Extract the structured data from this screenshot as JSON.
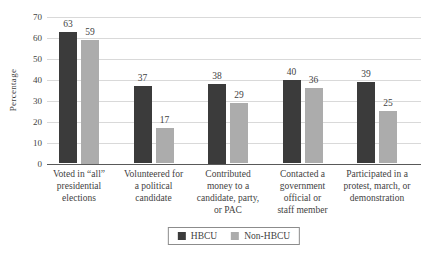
{
  "chart_data": {
    "type": "bar",
    "title": "",
    "xlabel": "",
    "ylabel": "Percentage",
    "ylim": [
      0,
      70
    ],
    "yticks": [
      0,
      10,
      20,
      30,
      40,
      50,
      60,
      70
    ],
    "grid": "horizontal",
    "legend_position": "bottom-center",
    "categories": [
      "Voted in “all” presidential elections",
      "Volunteered for a political candidate",
      "Contributed money to a candidate, party, or PAC",
      "Contacted a government official or staff member",
      "Participated in a protest, march, or demonstration"
    ],
    "categories_lines": [
      [
        "Voted in “all”",
        "presidential",
        "elections"
      ],
      [
        "Volunteered for",
        "a political",
        "candidate"
      ],
      [
        "Contributed",
        "money to a",
        "candidate, party,",
        "or PAC"
      ],
      [
        "Contacted a",
        "government",
        "official or",
        "staff member"
      ],
      [
        "Participated in a",
        "protest, march, or",
        "demonstration"
      ]
    ],
    "series": [
      {
        "name": "HBCU",
        "color": "#3b3b3b",
        "values": [
          63,
          37,
          38,
          40,
          39
        ]
      },
      {
        "name": "Non-HBCU",
        "color": "#acacac",
        "values": [
          59,
          17,
          29,
          36,
          25
        ]
      }
    ]
  },
  "colors": {
    "background": "#ffffff",
    "gridline": "#d9d9d9",
    "axis_line": "#595959",
    "text": "#3f3f3f",
    "legend_border": "#8c8c8c"
  }
}
